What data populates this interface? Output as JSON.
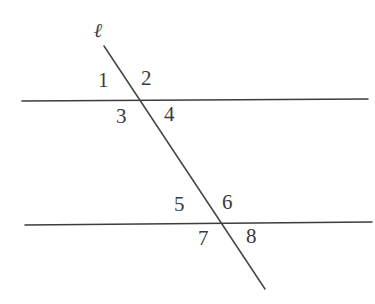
{
  "figure": {
    "background_color": "#ffffff",
    "stroke_color": "#3d3d3d",
    "label_color": "#3a3a3a",
    "width": 375,
    "height": 304
  },
  "transversal": {
    "label": "ℓ",
    "name": "transversal-line",
    "start": {
      "x": 104,
      "y": 46
    },
    "end": {
      "x": 265,
      "y": 289
    },
    "stroke_width": 1.4
  },
  "parallel_lines": [
    {
      "name": "upper-parallel-line",
      "start": {
        "x": 22,
        "y": 101
      },
      "end": {
        "x": 368,
        "y": 99
      },
      "stroke_width": 1.6
    },
    {
      "name": "lower-parallel-line",
      "start": {
        "x": 25,
        "y": 225
      },
      "end": {
        "x": 372,
        "y": 222
      },
      "stroke_width": 1.6
    }
  ],
  "intersections": [
    {
      "name": "upper-intersection",
      "x": 136,
      "y": 100
    },
    {
      "name": "lower-intersection",
      "x": 222,
      "y": 224
    }
  ],
  "angle_labels": [
    {
      "id": "1",
      "text": "1",
      "position": "upper-left",
      "vertex": "upper-intersection"
    },
    {
      "id": "2",
      "text": "2",
      "position": "upper-right",
      "vertex": "upper-intersection"
    },
    {
      "id": "3",
      "text": "3",
      "position": "lower-left",
      "vertex": "upper-intersection"
    },
    {
      "id": "4",
      "text": "4",
      "position": "lower-right",
      "vertex": "upper-intersection"
    },
    {
      "id": "5",
      "text": "5",
      "position": "upper-left",
      "vertex": "lower-intersection"
    },
    {
      "id": "6",
      "text": "6",
      "position": "upper-right",
      "vertex": "lower-intersection"
    },
    {
      "id": "7",
      "text": "7",
      "position": "lower-left",
      "vertex": "lower-intersection"
    },
    {
      "id": "8",
      "text": "8",
      "position": "lower-right",
      "vertex": "lower-intersection"
    }
  ]
}
